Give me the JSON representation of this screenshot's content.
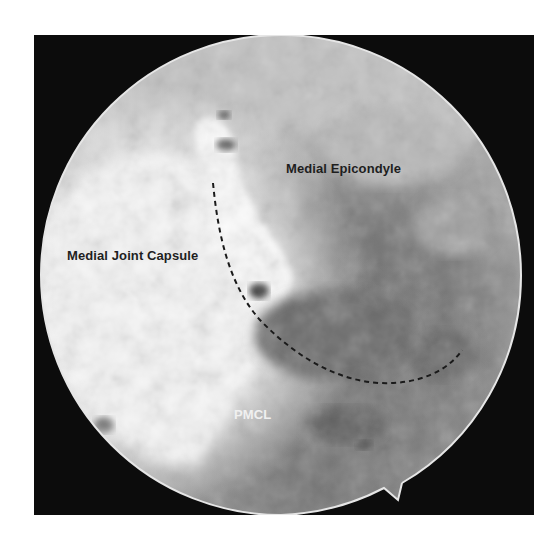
{
  "figure": {
    "type": "arthroscopic-view",
    "labels": {
      "medial_epicondyle": "Medial Epicondyle",
      "medial_joint_capsule": "Medial Joint Capsule",
      "pmcl": "PMCL"
    },
    "annotation": {
      "dashed_curve": "boundary-marker"
    },
    "colors": {
      "frame": "#0c0c0c",
      "scope_rim": "#e6e6e6",
      "bright_tissue": "#f7f7f7",
      "mid_tissue": "#a8a8a8",
      "dark_tissue": "#6e6e6e",
      "dashed_line": "#1a1a1a"
    }
  }
}
